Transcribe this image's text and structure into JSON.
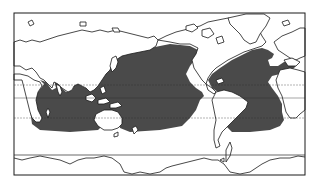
{
  "map": {
    "type": "world-map",
    "projection": "pacific-centered cylindrical",
    "frame": {
      "x": 14,
      "y": 13,
      "width": 291,
      "height": 162,
      "stroke": "#1a1a1a"
    },
    "colors": {
      "background": "#ffffff",
      "land_fill": "#ffffff",
      "coast_stroke": "#1a1a1a",
      "ocean_shaded": "#4a4a4a",
      "latitude_line": "#2a2a2a"
    },
    "latitude_lines": [
      {
        "name": "tropic-of-cancer",
        "y": 85
      },
      {
        "name": "equator",
        "y": 98
      },
      {
        "name": "tropic-of-capricorn",
        "y": 118
      },
      {
        "name": "antarctic-boundary",
        "y": 155
      }
    ],
    "shaded_region": {
      "label": "",
      "description": "tropical and subtropical ocean area shaded dark grey"
    }
  }
}
